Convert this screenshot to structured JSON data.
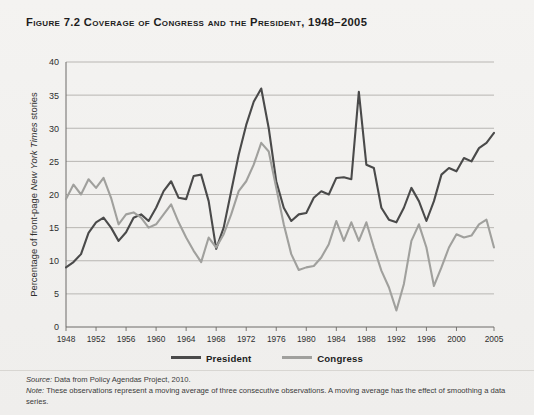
{
  "figure": {
    "number_label": "Figure 7.2",
    "title": "Coverage of Congress and the President, 1948–2005",
    "full_title": "Figure 7.2 Coverage of Congress and the President, 1948–2005"
  },
  "notes": {
    "source_lead": "Source:",
    "source_text": " Data from Policy Agendas Project, 2010.",
    "note_lead": "Note:",
    "note_text": " These observations represent a moving average of three consecutive observations. A moving average has the effect of smoothing a data series."
  },
  "legend": {
    "position": "bottom-center",
    "items": [
      {
        "label": "President",
        "color": "#4a4a4a"
      },
      {
        "label": "Congress",
        "color": "#a0a09d"
      }
    ]
  },
  "colors": {
    "president": "#4a4a4a",
    "congress": "#a0a09d",
    "grid": "#a9a7a3",
    "axis": "#6d6b68",
    "background": "#f1f0ee",
    "text": "#1d1d1d"
  },
  "chart_data": {
    "type": "line",
    "title": "Coverage of Congress and the President, 1948–2005",
    "subtitle": "",
    "xlabel": "Year",
    "ylabel": "Percentage of front-page New York Times stories",
    "ylabel_italic_part": "New York Times",
    "xlim": [
      1948,
      2005
    ],
    "ylim": [
      0,
      40
    ],
    "yticks": [
      0,
      5,
      10,
      15,
      20,
      25,
      30,
      35,
      40
    ],
    "xticks": [
      1948,
      1952,
      1956,
      1960,
      1964,
      1968,
      1972,
      1976,
      1980,
      1984,
      1988,
      1992,
      1996,
      2000,
      2005
    ],
    "xtick_labels": [
      "1948",
      "1952",
      "1956",
      "1960",
      "1964",
      "1968",
      "1972",
      "1976",
      "1980",
      "1984",
      "1988",
      "1992",
      "1996",
      "2000",
      "2005"
    ],
    "grid": "horizontal",
    "legend_position": "bottom",
    "x": [
      1948,
      1949,
      1950,
      1951,
      1952,
      1953,
      1954,
      1955,
      1956,
      1957,
      1958,
      1959,
      1960,
      1961,
      1962,
      1963,
      1964,
      1965,
      1966,
      1967,
      1968,
      1969,
      1970,
      1971,
      1972,
      1973,
      1974,
      1975,
      1976,
      1977,
      1978,
      1979,
      1980,
      1981,
      1982,
      1983,
      1984,
      1985,
      1986,
      1987,
      1988,
      1989,
      1990,
      1991,
      1992,
      1993,
      1994,
      1995,
      1996,
      1997,
      1998,
      1999,
      2000,
      2001,
      2002,
      2003,
      2004,
      2005
    ],
    "series": [
      {
        "name": "President",
        "color": "#4a4a4a",
        "values": [
          9.0,
          9.8,
          11.0,
          14.2,
          15.8,
          16.5,
          15.0,
          13.0,
          14.3,
          16.5,
          17.0,
          16.0,
          18.0,
          20.5,
          22.0,
          19.5,
          19.3,
          22.8,
          23.0,
          19.0,
          11.8,
          15.0,
          20.5,
          26.0,
          30.5,
          34.0,
          36.0,
          30.0,
          22.0,
          18.0,
          16.0,
          17.0,
          17.2,
          19.5,
          20.5,
          20.0,
          22.5,
          22.6,
          22.3,
          35.5,
          24.5,
          24.0,
          18.0,
          16.2,
          15.8,
          18.0,
          21.0,
          19.0,
          16.0,
          19.0,
          23.0,
          24.0,
          23.5,
          25.5,
          25.0,
          27.0,
          27.8,
          29.3
        ]
      },
      {
        "name": "Congress",
        "color": "#a0a09d",
        "values": [
          19.3,
          21.5,
          20.0,
          22.3,
          21.0,
          22.5,
          19.5,
          15.5,
          17.0,
          17.3,
          16.5,
          15.0,
          15.5,
          17.0,
          18.5,
          15.8,
          13.5,
          11.5,
          9.8,
          13.5,
          12.0,
          14.0,
          17.0,
          20.5,
          22.0,
          24.5,
          27.8,
          26.5,
          21.0,
          15.5,
          11.0,
          8.6,
          9.0,
          9.2,
          10.5,
          12.5,
          16.0,
          13.0,
          15.8,
          13.0,
          15.8,
          12.0,
          8.5,
          6.0,
          2.5,
          6.5,
          13.0,
          15.5,
          12.0,
          6.2,
          9.0,
          12.0,
          14.0,
          13.5,
          13.8,
          15.5,
          16.2,
          12.0
        ]
      }
    ]
  }
}
